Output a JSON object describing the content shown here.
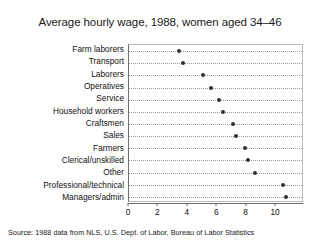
{
  "chart_data": {
    "type": "scatter",
    "title": "Average hourly wage, 1988, women aged 34–46",
    "xlabel": "",
    "ylabel": "",
    "xlim": [
      0,
      11.9
    ],
    "xticks": [
      0,
      2,
      4,
      6,
      8,
      10
    ],
    "xticklabels": [
      "0",
      "2",
      "4",
      "6",
      "8",
      "10"
    ],
    "grid": true,
    "grid_axis": "y",
    "legend": false,
    "orientation": "horizontal",
    "marker": "filled-circle",
    "marker_color": "#2f2f38",
    "categories": [
      "Farm laborers",
      "Transport",
      "Laborers",
      "Operatives",
      "Service",
      "Household workers",
      "Craftsmen",
      "Sales",
      "Farmers",
      "Clerical/unskilled",
      "Other",
      "Professional/technical",
      "Managers/admin"
    ],
    "values": [
      3.4,
      3.7,
      5.0,
      5.6,
      6.1,
      6.4,
      7.1,
      7.3,
      7.9,
      8.1,
      8.6,
      10.5,
      10.7
    ],
    "points": [
      {
        "label": "Farm laborers",
        "value": 3.4
      },
      {
        "label": "Transport",
        "value": 3.7
      },
      {
        "label": "Laborers",
        "value": 5.0
      },
      {
        "label": "Operatives",
        "value": 5.6
      },
      {
        "label": "Service",
        "value": 6.1
      },
      {
        "label": "Household workers",
        "value": 6.4
      },
      {
        "label": "Craftsmen",
        "value": 7.1
      },
      {
        "label": "Sales",
        "value": 7.3
      },
      {
        "label": "Farmers",
        "value": 7.9
      },
      {
        "label": "Clerical/unskilled",
        "value": 8.1
      },
      {
        "label": "Other",
        "value": 8.6
      },
      {
        "label": "Professional/technical",
        "value": 10.5
      },
      {
        "label": "Managers/admin",
        "value": 10.7
      }
    ],
    "annotations": [
      "Source:  1988 data from NLS, U.S. Dept. of Labor, Bureau of Labor Statistics"
    ]
  },
  "source_note": "Source:  1988 data from NLS, U.S. Dept. of Labor, Bureau of Labor Statistics"
}
